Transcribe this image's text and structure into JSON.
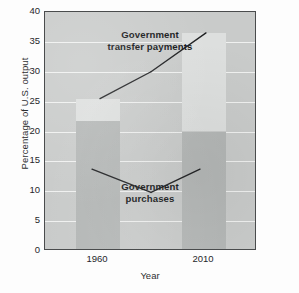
{
  "chart_data": {
    "type": "bar",
    "title": "",
    "subtitle": "",
    "xlabel": "Year",
    "ylabel": "Percentage of U.S. output",
    "categories": [
      "1960",
      "2010"
    ],
    "stacked": true,
    "series": [
      {
        "name": "Government purchases",
        "values": [
          21.7,
          20.0
        ],
        "color": "#b4b7b6"
      },
      {
        "name": "Government transfer payments",
        "values": [
          3.8,
          16.5
        ],
        "color": "#dddfde"
      }
    ],
    "bar_tops": [
      25.5,
      36.5
    ],
    "ylim": [
      0,
      40
    ],
    "xlim": [
      0,
      2
    ],
    "yticks": [
      0,
      5,
      10,
      15,
      20,
      25,
      30,
      35,
      40
    ],
    "ytick_labels": [
      "0",
      "5",
      "10",
      "15",
      "20",
      "25",
      "30",
      "35",
      "40"
    ],
    "grid": "horizontal-white",
    "legend": "none",
    "annotations": [
      {
        "id": "transfer-payments",
        "lines": [
          "Government",
          "transfer payments"
        ],
        "text": "Government transfer payments",
        "pointer": "caret-up",
        "points_to_values": [
          25.5,
          36.5
        ]
      },
      {
        "id": "purchases",
        "lines": [
          "Government",
          "purchases"
        ],
        "text": "Government purchases",
        "pointer": "caret-down",
        "points_to_values": [
          21.7,
          20.0
        ]
      }
    ],
    "plot_background": "#c9cbca",
    "border_color": "#4a4c4d"
  },
  "axes": {
    "y": {
      "label": "Percentage of U.S. output",
      "ticks": [
        {
          "value": 40,
          "label": "40"
        },
        {
          "value": 35,
          "label": "35"
        },
        {
          "value": 30,
          "label": "30"
        },
        {
          "value": 25,
          "label": "25"
        },
        {
          "value": 20,
          "label": "20"
        },
        {
          "value": 15,
          "label": "15"
        },
        {
          "value": 10,
          "label": "10"
        },
        {
          "value": 5,
          "label": "5"
        },
        {
          "value": 0,
          "label": "0"
        }
      ]
    },
    "x": {
      "label": "Year",
      "ticks": [
        {
          "value": 0.5,
          "label": "1960"
        },
        {
          "value": 1.5,
          "label": "2010"
        }
      ]
    }
  },
  "annotations": {
    "transfers": {
      "line1": "Government",
      "line2": "transfer payments"
    },
    "purchases": {
      "line1": "Government",
      "line2": "purchases"
    }
  }
}
